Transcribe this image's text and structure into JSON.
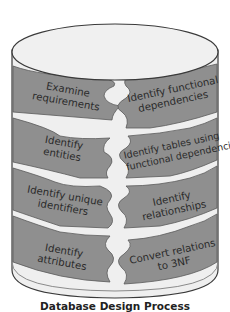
{
  "diagram": {
    "caption": "Database Design Process",
    "colors": {
      "cylinder_fill": "#efefef",
      "cylinder_outline": "#3a3a3a",
      "piece_fill": "#8f8f8f",
      "piece_outline": "#5a5a5a",
      "text": "#2a2a2a"
    },
    "left_column": [
      {
        "lines": [
          "Examine",
          "requirements"
        ]
      },
      {
        "lines": [
          "Identify",
          "entities"
        ]
      },
      {
        "lines": [
          "Identify unique",
          "identifiers"
        ]
      },
      {
        "lines": [
          "Identify",
          "attributes"
        ]
      }
    ],
    "right_column": [
      {
        "lines": [
          "Identify functional",
          "dependencies"
        ]
      },
      {
        "lines": [
          "Identify tables using",
          "functional dependencies"
        ]
      },
      {
        "lines": [
          "Identify",
          "relationships"
        ]
      },
      {
        "lines": [
          "Convert relations",
          "to 3NF"
        ]
      }
    ]
  }
}
